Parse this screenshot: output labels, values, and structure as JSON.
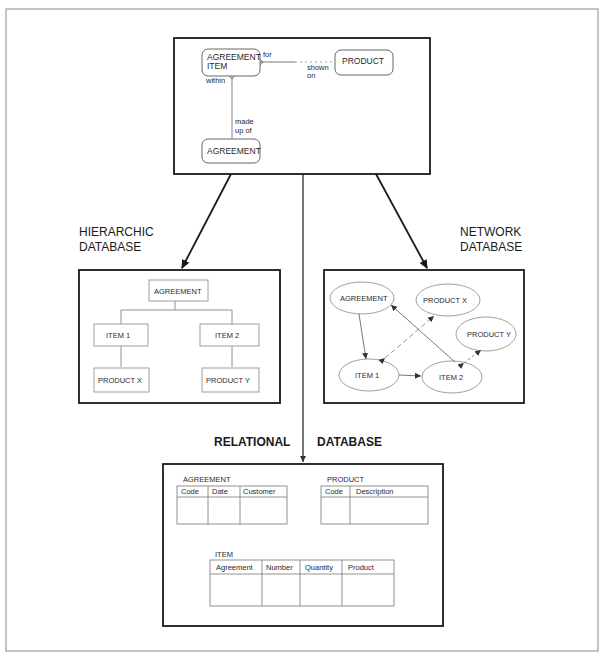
{
  "figure": {
    "title": "",
    "er_model": {
      "entities": [
        {
          "name": "agreement_item",
          "line1": "AGREEMENT",
          "line2": "ITEM"
        },
        {
          "name": "product",
          "label": "PRODUCT"
        },
        {
          "name": "agreement",
          "label": "AGREEMENT"
        }
      ],
      "relationships": {
        "for": "for",
        "shown": "shown",
        "on": "on",
        "within": "within",
        "made": "made",
        "up_of": "up of"
      }
    },
    "hierarchic": {
      "title_line1": "HIERARCHIC",
      "title_line2": "DATABASE",
      "nodes": {
        "root": "AGREEMENT",
        "item1": "ITEM 1",
        "item2": "ITEM 2",
        "productx": "PRODUCT X",
        "producty": "PRODUCT Y"
      }
    },
    "network": {
      "title_line1": "NETWORK",
      "title_line2": "DATABASE",
      "nodes": {
        "agreement": "AGREEMENT",
        "productx": "PRODUCT X",
        "producty": "PRODUCT Y",
        "item1": "ITEM 1",
        "item2": "ITEM 2"
      }
    },
    "relational": {
      "title_left": "RELATIONAL",
      "title_right": "DATABASE",
      "tables": {
        "agreement": {
          "name": "AGREEMENT",
          "columns": [
            "Code",
            "Date",
            "Customer"
          ]
        },
        "product": {
          "name": "PRODUCT",
          "columns": [
            "Code",
            "Description"
          ]
        },
        "item": {
          "name": "ITEM",
          "columns": [
            "Agreement",
            "Number",
            "Quantity",
            "Product"
          ]
        }
      }
    }
  }
}
